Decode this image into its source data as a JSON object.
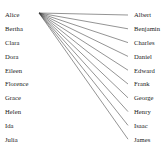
{
  "figure": {
    "width": 167,
    "height": 149,
    "background": "#ffffff",
    "edge_color": "#3a3a3a",
    "text_color": "#1a1a1a"
  },
  "layout": {
    "left_label_x": 5,
    "right_label_x": 134,
    "first_row_y": 15,
    "row_spacing": 13.8,
    "hub_x": 39,
    "hub_y": 13,
    "edge_end_x": 128
  },
  "chart_data": {
    "type": "diagram",
    "subtype": "bipartite-star-graph",
    "title": "",
    "left_set_label": "",
    "right_set_label": "",
    "left_nodes": [
      "Alice",
      "Bertha",
      "Clara",
      "Dora",
      "Eileen",
      "Florence",
      "Grace",
      "Helen",
      "Ida",
      "Julia"
    ],
    "right_nodes": [
      "Albert",
      "Benjamin",
      "Charles",
      "Daniel",
      "Edward",
      "Frank",
      "George",
      "Henry",
      "Isaac",
      "James"
    ],
    "edges": [
      {
        "from": "Alice",
        "to": "Albert"
      },
      {
        "from": "Alice",
        "to": "Benjamin"
      },
      {
        "from": "Alice",
        "to": "Charles"
      },
      {
        "from": "Alice",
        "to": "Daniel"
      },
      {
        "from": "Alice",
        "to": "Edward"
      },
      {
        "from": "Alice",
        "to": "Frank"
      },
      {
        "from": "Alice",
        "to": "George"
      },
      {
        "from": "Alice",
        "to": "Henry"
      },
      {
        "from": "Alice",
        "to": "Isaac"
      },
      {
        "from": "Alice",
        "to": "James"
      }
    ],
    "edge_count": 10,
    "legend": [],
    "annotations": []
  }
}
